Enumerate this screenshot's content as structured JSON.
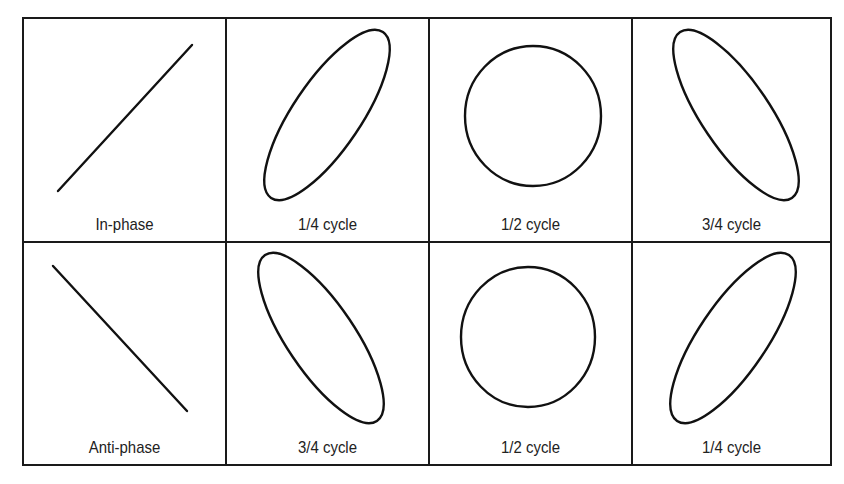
{
  "figure": {
    "title_fragment": "Lissajous figures for in-phase and out-of-phase signals",
    "stroke_color": "#111111",
    "border_color": "#1a1a1a",
    "background": "#ffffff"
  },
  "cells": [
    {
      "label": "In-phase",
      "shape": "line",
      "x1": 34,
      "y1": 172,
      "x2": 168,
      "y2": 26
    },
    {
      "label": "1/4 cycle",
      "shape": "ellipse",
      "cx": 100,
      "cy": 96,
      "rx": 100,
      "ry": 34,
      "rotate": -56
    },
    {
      "label": "1/2 cycle",
      "shape": "ellipse",
      "cx": 103,
      "cy": 97,
      "rx": 68,
      "ry": 70,
      "rotate": 0
    },
    {
      "label": "3/4 cycle",
      "shape": "ellipse",
      "cx": 103,
      "cy": 96,
      "rx": 100,
      "ry": 34,
      "rotate": 56
    },
    {
      "label": "Anti-phase",
      "shape": "line",
      "x1": 29,
      "y1": 23,
      "x2": 163,
      "y2": 168
    },
    {
      "label": "3/4 cycle",
      "shape": "ellipse",
      "cx": 94,
      "cy": 95,
      "rx": 100,
      "ry": 34,
      "rotate": 56
    },
    {
      "label": "1/2 cycle",
      "shape": "ellipse",
      "cx": 98,
      "cy": 94,
      "rx": 67,
      "ry": 70,
      "rotate": 0
    },
    {
      "label": "1/4 cycle",
      "shape": "ellipse",
      "cx": 100,
      "cy": 95,
      "rx": 100,
      "ry": 34,
      "rotate": -56
    }
  ]
}
